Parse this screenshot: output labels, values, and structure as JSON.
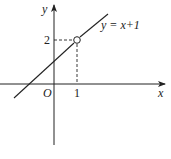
{
  "diagram": {
    "type": "function-graph",
    "equation_label": "y = x+1",
    "axes": {
      "x_label": "x",
      "y_label": "y",
      "origin_label": "O"
    },
    "ticks": {
      "x_tick_label": "1",
      "y_tick_label": "2"
    },
    "open_point": {
      "x": 1,
      "y": 2,
      "style": "hollow"
    },
    "colors": {
      "stroke": "#222222",
      "background": "#ffffff"
    }
  }
}
